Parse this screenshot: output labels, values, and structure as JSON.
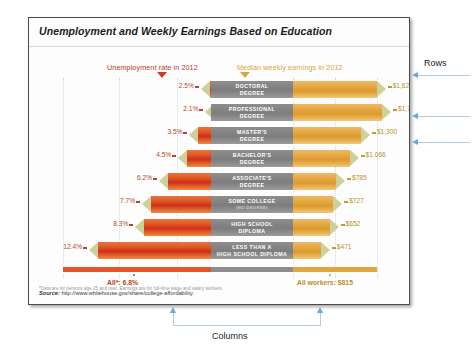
{
  "figure": {
    "title": "Unemployment and Weekly Earnings Based on Education",
    "legend_left": "Unemployment rate in 2012",
    "legend_right": "Median weekly earnings in 2012",
    "total_left": "All*: 6.8%",
    "total_right": "All workers: $815",
    "footnote": "*Data are for persons age 25 and over. Earnings are for full-time wage and salary workers.",
    "source_label": "Source:",
    "source_url": "http://www.whitehouse.gov/share/college-affordability."
  },
  "annotations": {
    "rows_label": "Rows",
    "columns_label": "Columns"
  },
  "colors": {
    "unemployment_accent": "#c0392b",
    "earnings_accent": "#d9a441",
    "label_block": "#8e8e8e",
    "pencil_tip": "#cdd09a",
    "annotation": "#6aa8d8"
  },
  "chart_data": {
    "type": "bar",
    "title": "Unemployment and Weekly Earnings Based on Education",
    "xlabel": "",
    "ylabel": "",
    "legend": [
      "Unemployment rate in 2012",
      "Median weekly earnings in 2012"
    ],
    "legend_position": "top",
    "grid": true,
    "categories": [
      "DOCTORAL DEGREE",
      "PROFESSIONAL DEGREE",
      "MASTER'S DEGREE",
      "BACHELOR'S DEGREE",
      "ASSOCIATE'S DEGREE",
      "SOME COLLEGE (NO DEGREE)",
      "HIGH SCHOOL DIPLOMA",
      "LESS THAN A HIGH SCHOOL DIPLOMA"
    ],
    "series": [
      {
        "name": "Unemployment rate in 2012",
        "unit": "%",
        "values": [
          2.5,
          2.1,
          3.5,
          4.5,
          6.2,
          7.7,
          8.3,
          12.4
        ],
        "labels": [
          "2.5%",
          "2.1%",
          "3.5%",
          "4.5%",
          "6.2%",
          "7.7%",
          "8.3%",
          "12.4%"
        ],
        "total_label": "All*: 6.8%",
        "total_value": 6.8
      },
      {
        "name": "Median weekly earnings in 2012",
        "unit": "$",
        "values": [
          1624,
          1735,
          1300,
          1066,
          785,
          727,
          652,
          471
        ],
        "labels": [
          "$1,624",
          "$1,735",
          "$1,300",
          "$1,066",
          "$785",
          "$727",
          "$652",
          "$471"
        ],
        "total_label": "All workers: $815",
        "total_value": 815
      }
    ]
  },
  "rows": [
    {
      "l1": "DOCTORAL",
      "l2": "DEGREE",
      "l3": "",
      "pct": "2.5%",
      "val": "$1,624",
      "pctv": 2.5,
      "valv": 1624
    },
    {
      "l1": "PROFESSIONAL",
      "l2": "DEGREE",
      "l3": "",
      "pct": "2.1%",
      "val": "$1,735",
      "pctv": 2.1,
      "valv": 1735
    },
    {
      "l1": "MASTER'S",
      "l2": "DEGREE",
      "l3": "",
      "pct": "3.5%",
      "val": "$1,300",
      "pctv": 3.5,
      "valv": 1300
    },
    {
      "l1": "BACHELOR'S",
      "l2": "DEGREE",
      "l3": "",
      "pct": "4.5%",
      "val": "$1,066",
      "pctv": 4.5,
      "valv": 1066
    },
    {
      "l1": "ASSOCIATE'S",
      "l2": "DEGREE",
      "l3": "",
      "pct": "6.2%",
      "val": "$785",
      "pctv": 6.2,
      "valv": 785
    },
    {
      "l1": "SOME COLLEGE",
      "l2": "",
      "l3": "(NO DEGREE)",
      "pct": "7.7%",
      "val": "$727",
      "pctv": 7.7,
      "valv": 727
    },
    {
      "l1": "HIGH SCHOOL",
      "l2": "DIPLOMA",
      "l3": "",
      "pct": "8.3%",
      "val": "$652",
      "pctv": 8.3,
      "valv": 652
    },
    {
      "l1": "LESS THAN A",
      "l2": "HIGH SCHOOL DIPLOMA",
      "l3": "",
      "pct": "12.4%",
      "val": "$471",
      "pctv": 12.4,
      "valv": 471
    }
  ]
}
